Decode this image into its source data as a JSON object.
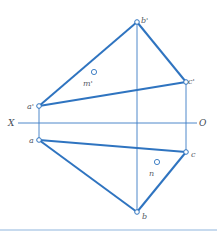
{
  "diagram": {
    "colors": {
      "line": "#2f74c0",
      "thin_line": "#3a7cc4",
      "axis": "#3a7cc4",
      "rule": "#8fb6de",
      "label": "#555a66"
    },
    "axis": {
      "left_label": "X",
      "right_label": "O"
    },
    "points": {
      "b_prime": "b'",
      "c_prime": "c'",
      "a_prime": "a'",
      "a": "a",
      "c": "c",
      "b": "b",
      "m_prime": "m'",
      "n": "n"
    }
  }
}
